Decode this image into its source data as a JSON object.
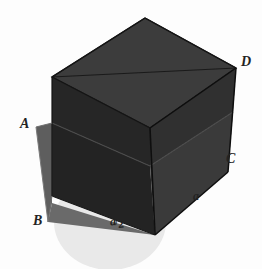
{
  "figure": {
    "background_color": "#fdfdfd",
    "labels": {
      "A": "A",
      "B": "B",
      "C": "C",
      "D": "D",
      "edge_a": "a",
      "half_edge_numerator": "a",
      "half_edge_slash": "/",
      "half_edge_denominator": "2"
    },
    "colors": {
      "cube_top_face": "#3a3a3a",
      "cube_front_face": "#1e1e1e",
      "cube_right_face": "#2e2e2e",
      "cube_lower_front": "#262626",
      "cube_lower_right": "#343434",
      "cutting_plane": "#5a5a5a",
      "plane_over_cube": "#2a2a2a",
      "circle_light": "#e8e8e8",
      "edge_stroke": "#111111",
      "label_text": "#232323"
    },
    "geometry": {
      "projection": "oblique",
      "cube_vertices": {
        "top_back": [
          145,
          18
        ],
        "top_left": [
          52,
          77
        ],
        "top_front": [
          150,
          128
        ],
        "top_right": [
          236,
          68
        ],
        "bottom_left": [
          52,
          196
        ],
        "bottom_front": [
          155,
          235
        ],
        "bottom_right": [
          228,
          172
        ]
      },
      "plane_corners": {
        "A": [
          36,
          127
        ],
        "B": [
          48,
          222
        ]
      },
      "circle": {
        "cx": 110,
        "cy": 222,
        "rx": 56,
        "ry": 48
      }
    }
  }
}
